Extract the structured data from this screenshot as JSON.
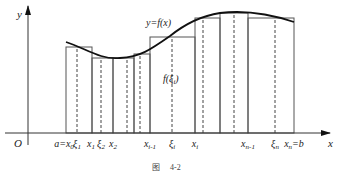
{
  "diagram": {
    "type": "riemann-sum",
    "axes": {
      "origin_label": "O",
      "x_label": "x",
      "y_label": "y"
    },
    "curve_label": "y=f(x)",
    "height_label": "f(ξ",
    "height_label_sub": "i",
    "height_label_close": ")",
    "partition_labels": [
      {
        "base": "a=x",
        "sub": "0",
        "x": 64
      },
      {
        "base": "ξ",
        "sub": "1",
        "x": 77
      },
      {
        "base": "x",
        "sub": "1",
        "x": 91
      },
      {
        "base": "ξ",
        "sub": "2",
        "x": 101
      },
      {
        "base": "x",
        "sub": "2",
        "x": 113
      },
      {
        "base": "x",
        "sub": "i-1",
        "x": 150
      },
      {
        "base": "ξ",
        "sub": "i",
        "x": 172
      },
      {
        "base": "x",
        "sub": "i",
        "x": 195
      },
      {
        "base": "x",
        "sub": "n-1",
        "x": 248
      },
      {
        "base": "ξ",
        "sub": "n",
        "x": 275
      },
      {
        "base": "x",
        "sub": "n",
        "suffix": "=b",
        "x": 294
      }
    ],
    "rectangles": [
      {
        "x0": 66,
        "x1": 92,
        "xi": 77,
        "top": 47
      },
      {
        "x0": 92,
        "x1": 113,
        "xi": 101,
        "top": 58
      },
      {
        "x0": 113,
        "x1": 134,
        "xi": 127,
        "top": 58
      },
      {
        "x0": 134,
        "x1": 150,
        "xi": 140,
        "top": 54
      },
      {
        "x0": 150,
        "x1": 195,
        "xi": 172,
        "top": 37
      },
      {
        "x0": 195,
        "x1": 220,
        "xi": 203,
        "top": 18
      },
      {
        "x0": 220,
        "x1": 248,
        "xi": 234,
        "top": 13
      },
      {
        "x0": 248,
        "x1": 294,
        "xi": 275,
        "top": 18
      }
    ],
    "caption": {
      "prefix": "图",
      "number": "4-2"
    }
  }
}
